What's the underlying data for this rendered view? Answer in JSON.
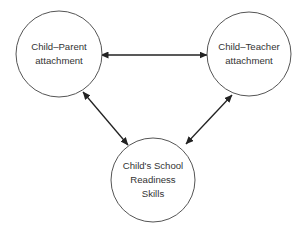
{
  "diagram": {
    "type": "relationship-triangle",
    "nodes": [
      {
        "id": "parent",
        "lines": [
          "Child–Parent",
          "attachment"
        ],
        "cx": 59,
        "cy": 54,
        "r": 43
      },
      {
        "id": "teacher",
        "lines": [
          "Child–Teacher",
          "attachment"
        ],
        "cx": 249,
        "cy": 54,
        "r": 42
      },
      {
        "id": "school",
        "lines": [
          "Child's School",
          "Readiness",
          "Skills"
        ],
        "cx": 153,
        "cy": 180,
        "r": 42
      }
    ],
    "edges": [
      {
        "from": "parent",
        "to": "teacher",
        "direction": "bidirectional",
        "x1": 101,
        "y1": 55,
        "x2": 207,
        "y2": 55
      },
      {
        "from": "parent",
        "to": "school",
        "direction": "bidirectional",
        "x1": 83,
        "y1": 92,
        "x2": 128,
        "y2": 145
      },
      {
        "from": "teacher",
        "to": "school",
        "direction": "bidirectional",
        "x1": 232,
        "y1": 95,
        "x2": 186,
        "y2": 144
      }
    ],
    "colors": {
      "circle_stroke": "#555555",
      "arrow": "#222222",
      "text": "#333333",
      "background": "#ffffff"
    }
  }
}
